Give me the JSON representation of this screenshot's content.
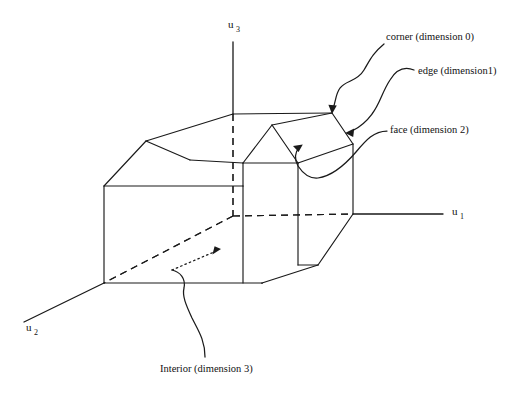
{
  "figure": {
    "background_color": "#ffffff",
    "line_color": "#1a1a1a",
    "width": 527,
    "height": 393
  },
  "axes": [
    {
      "name": "u3",
      "base": "u",
      "subscript": "3",
      "label_x": 228,
      "label_y": 28
    },
    {
      "name": "u1",
      "base": "u",
      "subscript": "1",
      "label_x": 452,
      "label_y": 215
    },
    {
      "name": "u2",
      "base": "u",
      "subscript": "2",
      "label_x": 26,
      "label_y": 331
    }
  ],
  "annotations": [
    {
      "id": "corner",
      "label": "corner (dimension 0)",
      "dimension": 0,
      "text_x": 386,
      "text_y": 40,
      "target": "top-right-corner-vertex"
    },
    {
      "id": "edge",
      "label": "edge (dimension1)",
      "dimension": 1,
      "text_x": 418,
      "text_y": 74,
      "target": "bevelled-edge"
    },
    {
      "id": "face",
      "label": "face (dimension 2)",
      "dimension": 2,
      "text_x": 390,
      "text_y": 133,
      "target": "slanted-roof-face"
    },
    {
      "id": "interior",
      "label": "Interior (dimension 3)",
      "dimension": 3,
      "text_x": 160,
      "text_y": 372,
      "target": "solid-interior"
    }
  ],
  "geometry": {
    "description": "Beveled house-like polyhedron drawn in oblique projection with hidden edges dashed",
    "solid_vertices": {
      "left_lower_front": [
        104,
        283
      ],
      "left_upper_front": [
        104,
        186
      ],
      "left_bevel_top": [
        146,
        141
      ],
      "ridge_back_left": [
        233,
        114
      ],
      "top_front_left": [
        190,
        160
      ],
      "gable_apex": [
        272,
        125
      ],
      "gable_left_base": [
        243,
        163
      ],
      "gable_right_base": [
        298,
        163
      ],
      "ridge_back_right": [
        332,
        113
      ],
      "right_bevel_outer": [
        353,
        144
      ],
      "right_lower": [
        353,
        214
      ],
      "bottom_bevel": [
        318,
        265
      ],
      "front_bottom_right": [
        262,
        283
      ]
    }
  }
}
